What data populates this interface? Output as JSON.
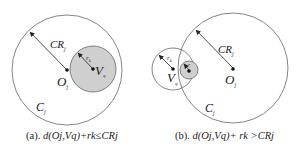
{
  "panels": [
    {
      "id": "a",
      "caption_prefix": "(a). ",
      "caption_expr": "d(Oj,Vq)+rk≤CRj",
      "labels": {
        "cr": "CR",
        "cr_sub": "j",
        "rk": "r",
        "rk_sub": "k",
        "o": "O",
        "o_sub": "j",
        "v": "V",
        "v_sub": "q",
        "c": "C",
        "c_sub": "j"
      }
    },
    {
      "id": "b",
      "caption_prefix": "(b). ",
      "caption_expr": "d(Oj,Vq)+ rk >CRj",
      "labels": {
        "cr": "CR",
        "cr_sub": "j",
        "rk": "r",
        "rk_sub": "k",
        "rk_small": "r",
        "o": "O",
        "o_sub": "j",
        "v": "V",
        "v_sub": "q",
        "c": "C",
        "c_sub": "j"
      }
    }
  ],
  "colors": {
    "stroke": "#555555",
    "fill_gray": "#cfcfcf",
    "text": "#222222"
  }
}
